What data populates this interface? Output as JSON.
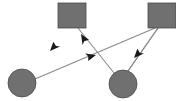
{
  "canvas": {
    "width": 176,
    "height": 101,
    "background_color": "#ffffff"
  },
  "style": {
    "node_fill_color": "#707070",
    "node_stroke_color": "#4a4a4a",
    "edge_color": "#8a8a8a",
    "arrowhead_color": "#1a1a1a",
    "edge_width": 1.1,
    "node_stroke_width": 0.8
  },
  "diagram": {
    "type": "directed-graph",
    "title": "",
    "node_count": 4,
    "edge_count": 4,
    "nodes": [
      {
        "id": "square-top-left",
        "shape": "square",
        "label": "",
        "x": 58,
        "y": 3,
        "width": 28,
        "height": 25,
        "fill": "#707070"
      },
      {
        "id": "square-top-right",
        "shape": "square",
        "label": "",
        "x": 148,
        "y": 3,
        "width": 28,
        "height": 25,
        "fill": "#707070"
      },
      {
        "id": "circle-bottom-left",
        "shape": "circle",
        "label": "",
        "cx": 22,
        "cy": 83,
        "r": 14,
        "fill": "#707070"
      },
      {
        "id": "circle-bottom-right",
        "shape": "circle",
        "label": "",
        "cx": 123,
        "cy": 84,
        "r": 14,
        "fill": "#707070"
      }
    ],
    "edges": [
      {
        "id": "edge-square-tl-to-circle-bl",
        "from": "square-top-left",
        "to": "circle-bottom-left",
        "x1": 64,
        "y1": 28,
        "x2": 33,
        "y2": 72,
        "arrow_x": 50,
        "arrow_y": 51,
        "directed": true
      },
      {
        "id": "edge-circle-br-to-square-tl",
        "from": "circle-bottom-right",
        "to": "square-top-left",
        "x1": 114,
        "y1": 73,
        "x2": 78,
        "y2": 28,
        "arrow_x": 81,
        "arrow_y": 34,
        "directed": true
      },
      {
        "id": "edge-circle-bl-to-square-tr",
        "from": "circle-bottom-left",
        "to": "square-top-right",
        "x1": 35,
        "y1": 79,
        "x2": 155,
        "y2": 28,
        "arrow_x": 96,
        "arrow_y": 55,
        "directed": true
      },
      {
        "id": "edge-square-tr-to-circle-br",
        "from": "square-top-right",
        "to": "circle-bottom-right",
        "x1": 158,
        "y1": 28,
        "x2": 128,
        "y2": 71,
        "arrow_x": 134,
        "arrow_y": 58,
        "directed": true
      }
    ]
  }
}
